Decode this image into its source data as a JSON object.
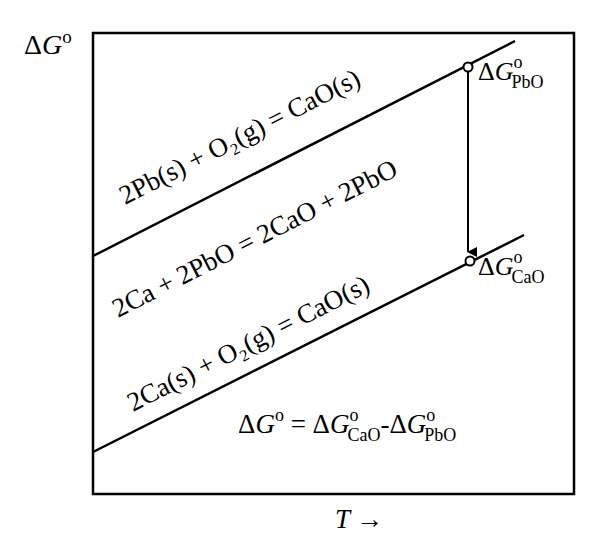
{
  "axes": {
    "y_label_delta": "Δ",
    "y_label_var": "G",
    "y_label_sup": "o",
    "x_label_var": "T",
    "x_label_arrow": "→"
  },
  "lines": {
    "upper_label": "2Pb(s) + O₂(g) = CaO(s)",
    "middle_label": "2Ca + 2PbO = 2CaO + 2PbO",
    "lower_label": "2Ca(s) + O₂(g) = CaO(s)"
  },
  "points": {
    "pbo": {
      "delta": "Δ",
      "var": "G",
      "sup": "o",
      "sub": "PbO"
    },
    "cao": {
      "delta": "Δ",
      "var": "G",
      "sup": "o",
      "sub": "CaO"
    }
  },
  "equation": {
    "lhs_delta": "Δ",
    "lhs_var": "G",
    "lhs_sup": "o",
    "eq": " = ",
    "t1_delta": "Δ",
    "t1_var": "G",
    "t1_sup": "o",
    "t1_sub": "CaO",
    "minus": "-",
    "t2_delta": "Δ",
    "t2_var": "G",
    "t2_sup": "o",
    "t2_sub": "PbO"
  },
  "colors": {
    "stroke": "#000000",
    "background": "#ffffff"
  }
}
